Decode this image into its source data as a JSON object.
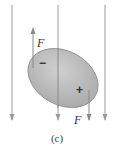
{
  "diagram": {
    "caption": "(c)",
    "force_label_up": "F",
    "force_label_down": "F",
    "minus_sign": "−",
    "plus_sign": "+",
    "colors": {
      "field_line": "#9a9a9a",
      "body_fill": "#b8b8b8",
      "body_stroke": "#8a8a8a"
    }
  }
}
